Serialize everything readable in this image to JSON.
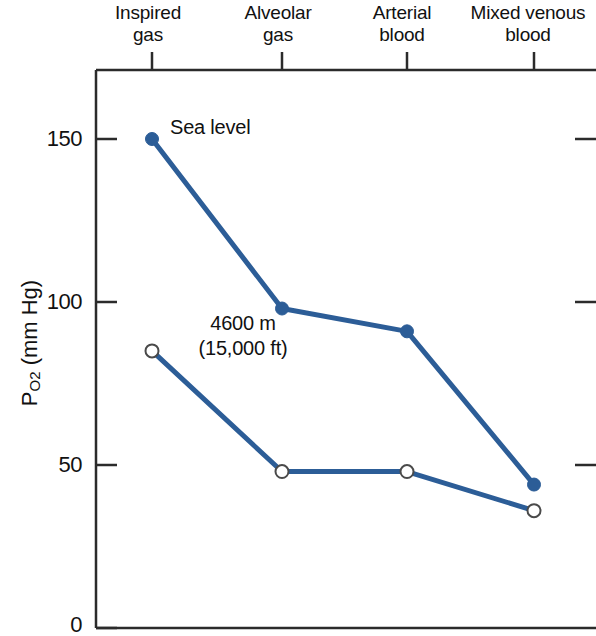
{
  "chart_data": {
    "type": "line",
    "title": "",
    "subtitle": "",
    "xlabel": "",
    "ylabel": "PO2 (mm Hg)",
    "ylabel_parts": {
      "base": "P",
      "sub": "O",
      "sub2": "2",
      "units": " (mm Hg)"
    },
    "categories": [
      "Inspired\ngas",
      "Alveolar\ngas",
      "Arterial\nblood",
      "Mixed venous\nblood"
    ],
    "ytick_labels": [
      "0",
      "50",
      "100",
      "150"
    ],
    "yticks": [
      0,
      50,
      100,
      150
    ],
    "ylim": [
      0,
      172
    ],
    "grid": false,
    "legend_position": "inline-annotation",
    "series": [
      {
        "name": "Sea level",
        "marker": "filled-circle",
        "color": "#2c5d97",
        "values": [
          150,
          98,
          91,
          44
        ]
      },
      {
        "name": "4600 m\n(15,000 ft)",
        "marker": "open-circle",
        "color": "#2c5d97",
        "values": [
          85,
          48,
          48,
          36
        ]
      }
    ],
    "annotations": [
      {
        "text": "Sea level",
        "series": "Sea level",
        "near_point_index": 0
      },
      {
        "text": "4600 m\n(15,000 ft)",
        "series": "4600 m\n(15,000 ft)",
        "near_point_index": 0
      }
    ],
    "colors": {
      "line": "#2c5d97",
      "axis": "#2b2b2b",
      "text": "#111111",
      "background": "#ffffff"
    }
  }
}
